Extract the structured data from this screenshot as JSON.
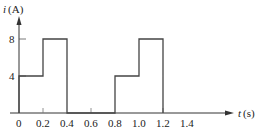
{
  "chart_data": {
    "type": "line",
    "title": "",
    "xlabel": "t (s)",
    "ylabel": "i (A)",
    "xlabel_var": "t",
    "xlabel_unit": "(s)",
    "ylabel_var": "i",
    "ylabel_unit": "(A)",
    "x_ticks": [
      "0",
      "0.2",
      "0.4",
      "0.6",
      "0.8",
      "1.0",
      "1.2",
      "1.4"
    ],
    "y_ticks": [
      "4",
      "8"
    ],
    "xlim": [
      0,
      1.6
    ],
    "ylim": [
      0,
      10
    ],
    "grid": false,
    "series": [
      {
        "name": "i(t)",
        "step": true,
        "x": [
          0,
          0,
          0.2,
          0.2,
          0.4,
          0.4,
          0.8,
          0.8,
          1.0,
          1.0,
          1.2,
          1.2,
          1.6
        ],
        "y": [
          0,
          4,
          4,
          8,
          8,
          0,
          0,
          4,
          4,
          8,
          8,
          0,
          0
        ]
      }
    ],
    "segments": [
      {
        "t_start": 0.0,
        "t_end": 0.2,
        "value": 4
      },
      {
        "t_start": 0.2,
        "t_end": 0.4,
        "value": 8
      },
      {
        "t_start": 0.4,
        "t_end": 0.8,
        "value": 0
      },
      {
        "t_start": 0.8,
        "t_end": 1.0,
        "value": 4
      },
      {
        "t_start": 1.0,
        "t_end": 1.2,
        "value": 8
      },
      {
        "t_start": 1.2,
        "t_end": 1.6,
        "value": 0
      }
    ],
    "period_s": 0.8
  }
}
